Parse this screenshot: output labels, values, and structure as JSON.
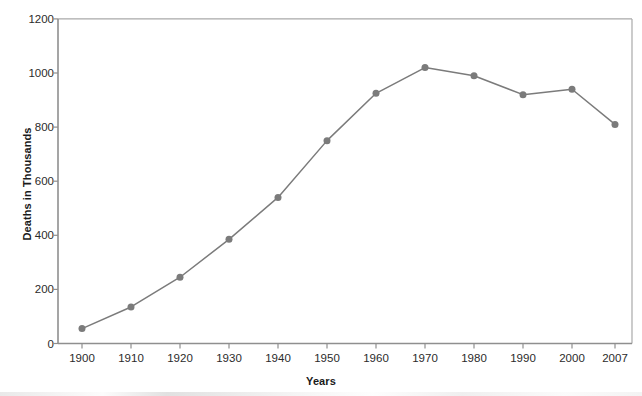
{
  "chart_data": {
    "type": "line",
    "title": "",
    "xlabel": "Years",
    "ylabel": "Deaths in Thousands",
    "categories": [
      "1900",
      "1910",
      "1920",
      "1930",
      "1940",
      "1950",
      "1960",
      "1970",
      "1980",
      "1990",
      "2000",
      "2007"
    ],
    "values": [
      55,
      135,
      245,
      385,
      540,
      750,
      925,
      1020,
      990,
      920,
      940,
      810
    ],
    "xtick_labels": [
      "1900",
      "1910",
      "1920",
      "1930",
      "1940",
      "1950",
      "1960",
      "1970",
      "1980",
      "1990",
      "2000",
      "2007"
    ],
    "ytick_labels": [
      "0",
      "200",
      "400",
      "600",
      "800",
      "1000",
      "1200"
    ],
    "ytick_values": [
      0,
      200,
      400,
      600,
      800,
      1000,
      1200
    ],
    "ylim": [
      0,
      1200
    ],
    "grid": false,
    "legend": false,
    "series": [
      {
        "name": "Deaths",
        "values": [
          55,
          135,
          245,
          385,
          540,
          750,
          925,
          1020,
          990,
          920,
          940,
          810
        ]
      }
    ],
    "colors": {
      "line": "#7b7b7b",
      "marker": "#7b7b7b",
      "axis": "#8c8c8c",
      "text": "#2b2b2b",
      "background": "#ffffff"
    }
  }
}
